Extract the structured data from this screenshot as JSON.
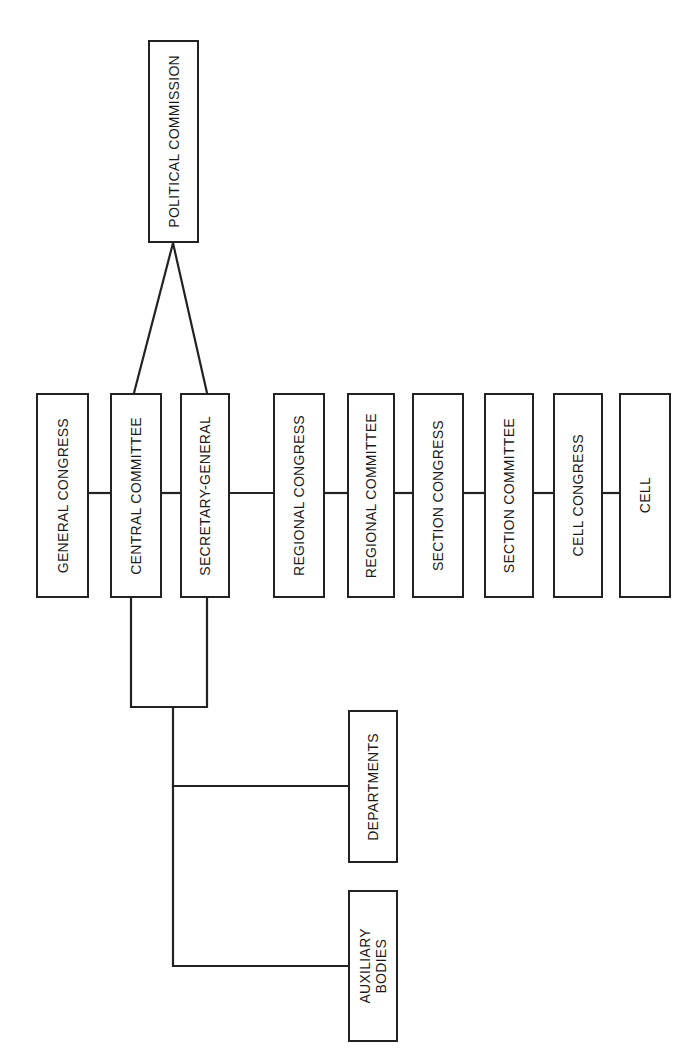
{
  "diagram": {
    "orientation": "rotated 90° counter-clockwise (text reads bottom-to-top)",
    "nodes": {
      "political_commission": "POLITICAL COMMISSION",
      "general_congress": "GENERAL CONGRESS",
      "central_committee": "CENTRAL COMMITTEE",
      "secretary_general": "SECRETARY-GENERAL",
      "regional_congress": "REGIONAL CONGRESS",
      "regional_committee": "REGIONAL COMMITTEE",
      "section_congress": "SECTION CONGRESS",
      "section_committee": "SECTION COMMITTEE",
      "cell_congress": "CELL CONGRESS",
      "cell": "CELL",
      "departments": "DEPARTMENTS",
      "auxiliary_bodies": "AUXILIARY\nBODIES"
    },
    "edges": [
      [
        "political_commission",
        "central_committee"
      ],
      [
        "political_commission",
        "secretary_general"
      ],
      [
        "general_congress",
        "central_committee"
      ],
      [
        "central_committee",
        "secretary_general"
      ],
      [
        "secretary_general",
        "regional_congress"
      ],
      [
        "regional_congress",
        "regional_committee"
      ],
      [
        "regional_committee",
        "section_congress"
      ],
      [
        "section_congress",
        "section_committee"
      ],
      [
        "section_committee",
        "cell_congress"
      ],
      [
        "cell_congress",
        "cell"
      ],
      [
        "central_committee+secretary_general",
        "departments"
      ],
      [
        "central_committee+secretary_general",
        "auxiliary_bodies"
      ]
    ],
    "line_color": "#222222"
  }
}
